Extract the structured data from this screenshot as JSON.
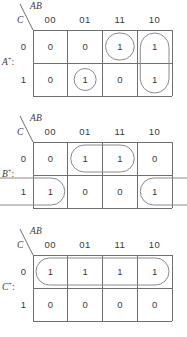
{
  "figure": {
    "title": "Karnaugh maps for next-state equations",
    "grid_color": "#6f6f6f",
    "group_color": "#8a8a8a",
    "text_color": "#3b3b3b"
  },
  "axis": {
    "column_variables": "AB",
    "row_variable": "C",
    "column_headers": [
      "00",
      "01",
      "11",
      "10"
    ],
    "row_headers": [
      "0",
      "1"
    ]
  },
  "maps": [
    {
      "name": "A",
      "superscript": "+",
      "colon": ":",
      "rows": [
        [
          "0",
          "0",
          "1",
          "1"
        ],
        [
          "0",
          "1",
          "0",
          "1"
        ]
      ],
      "groups": [
        {
          "shape": "oval",
          "row": 0,
          "col_start": 2,
          "col_end": 2,
          "wrap": false
        },
        {
          "shape": "oval",
          "row": 0,
          "col_start": 3,
          "col_end": 3,
          "row_span": 2,
          "wrap": false
        },
        {
          "shape": "circle",
          "row": 1,
          "col_start": 1,
          "col_end": 1,
          "wrap": false
        }
      ]
    },
    {
      "name": "B",
      "superscript": "+",
      "colon": ":",
      "rows": [
        [
          "0",
          "1",
          "1",
          "0"
        ],
        [
          "1",
          "0",
          "0",
          "1"
        ]
      ],
      "groups": [
        {
          "shape": "oval",
          "row": 0,
          "col_start": 1,
          "col_end": 2,
          "wrap": false
        },
        {
          "shape": "oval",
          "row": 1,
          "col_start": 3,
          "col_end": 0,
          "wrap": true
        }
      ]
    },
    {
      "name": "C",
      "superscript": "+",
      "colon": ":",
      "rows": [
        [
          "1",
          "1",
          "1",
          "1"
        ],
        [
          "0",
          "0",
          "0",
          "0"
        ]
      ],
      "groups": [
        {
          "shape": "oval",
          "row": 0,
          "col_start": 0,
          "col_end": 3,
          "wrap": false
        }
      ]
    }
  ]
}
